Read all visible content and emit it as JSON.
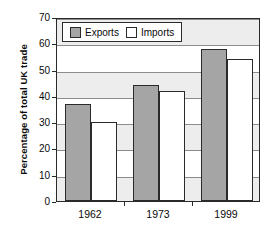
{
  "chart_data": {
    "type": "bar",
    "title": "",
    "xlabel": "",
    "ylabel": "Percentage of total UK trade",
    "categories": [
      "1962",
      "1973",
      "1999"
    ],
    "series": [
      {
        "name": "Exports",
        "values": [
          37,
          44,
          58
        ],
        "color": "#a5a5a5"
      },
      {
        "name": "Imports",
        "values": [
          30,
          42,
          54
        ],
        "color": "#ffffff"
      }
    ],
    "ylim": [
      0,
      70
    ],
    "ytick_labels": [
      "0",
      "10",
      "20",
      "30",
      "40",
      "50",
      "60",
      "70"
    ],
    "ytick_values": [
      0,
      10,
      20,
      30,
      40,
      50,
      60,
      70
    ],
    "grid": true,
    "legend_position": "top-left"
  },
  "legend": {
    "items": [
      {
        "label": "Exports",
        "swatch": "exports-swatch"
      },
      {
        "label": "Imports",
        "swatch": "imports-swatch"
      }
    ]
  }
}
